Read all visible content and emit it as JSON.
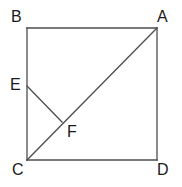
{
  "figure": {
    "background_color": "#ffffff",
    "stroke_color": "#4d4d4d",
    "label_color": "#1a1a1a",
    "stroke_width": 1.3
  },
  "points": {
    "B": {
      "label": "B",
      "x": 27,
      "y": 28,
      "label_x": 11,
      "label_y": 9
    },
    "A": {
      "label": "A",
      "x": 157,
      "y": 28,
      "label_x": 157,
      "label_y": 9
    },
    "E": {
      "label": "E",
      "x": 27,
      "y": 86,
      "label_x": 10,
      "label_y": 77
    },
    "F": {
      "label": "F",
      "x": 62,
      "y": 122,
      "label_x": 67,
      "label_y": 124
    },
    "C": {
      "label": "C",
      "x": 27,
      "y": 160,
      "label_x": 12,
      "label_y": 162
    },
    "D": {
      "label": "D",
      "x": 157,
      "y": 160,
      "label_x": 157,
      "label_y": 162
    }
  },
  "segments": {
    "square_top": {
      "name": "BA",
      "x1": 27,
      "y1": 28,
      "x2": 157,
      "y2": 28
    },
    "square_right": {
      "name": "AD",
      "x1": 157,
      "y1": 28,
      "x2": 157,
      "y2": 160
    },
    "square_bottom": {
      "name": "CD",
      "x1": 27,
      "y1": 160,
      "x2": 157,
      "y2": 160
    },
    "square_left": {
      "name": "BC",
      "x1": 27,
      "y1": 28,
      "x2": 27,
      "y2": 160
    },
    "diagonal": {
      "name": "CA",
      "x1": 27,
      "y1": 160,
      "x2": 157,
      "y2": 28
    },
    "segment_ef": {
      "name": "EF",
      "x1": 27,
      "y1": 86,
      "x2": 62,
      "y2": 122
    }
  }
}
